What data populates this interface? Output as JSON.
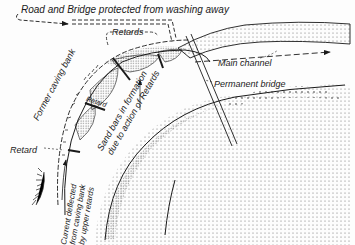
{
  "diagram": {
    "type": "river-training plan sketch",
    "labels": {
      "top_note": "Road and Bridge protected from washing away",
      "retards_top": "Retards",
      "main_channel": "Main channel",
      "permanent_bridge": "Permanent bridge",
      "former_caving_bank": "Former caving bank",
      "retard_inner": "Retard",
      "sand_bars_line1": "Sand bars in formation",
      "sand_bars_line2": "due to action of Retards",
      "retard_left": "Retard",
      "current_line1": "Current deflected",
      "current_line2": "from caving bank",
      "current_line3": "by upper retards"
    },
    "colors": {
      "ink": "#1a1a1a",
      "background": "#fdfdfd",
      "stipple": "#555555"
    }
  }
}
